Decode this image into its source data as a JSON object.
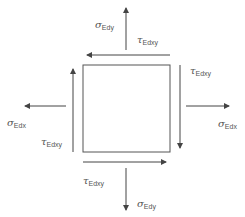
{
  "diagram": {
    "colors": {
      "line": "#444444",
      "text": "#555555",
      "background": "#ffffff"
    },
    "element": {
      "shape": "square"
    },
    "labels": {
      "sigma_top": {
        "symbol": "σ",
        "subscript": "Edy"
      },
      "tau_top": {
        "symbol": "τ",
        "subscript": "Edxy"
      },
      "tau_right": {
        "symbol": "τ",
        "subscript": "Edxy"
      },
      "sigma_left": {
        "symbol": "σ",
        "subscript": "Edx"
      },
      "sigma_right": {
        "symbol": "σ",
        "subscript": "Edx"
      },
      "tau_left": {
        "symbol": "τ",
        "subscript": "Edxy"
      },
      "tau_bottom": {
        "symbol": "τ",
        "subscript": "Edxy"
      },
      "sigma_bottom": {
        "symbol": "σ",
        "subscript": "Edy"
      }
    },
    "arrows": [
      {
        "name": "sigma-top-arrow",
        "direction": "up"
      },
      {
        "name": "tau-top-arrow",
        "direction": "left"
      },
      {
        "name": "tau-right-arrow",
        "direction": "down"
      },
      {
        "name": "tau-left-arrow",
        "direction": "up"
      },
      {
        "name": "tau-bottom-arrow",
        "direction": "right"
      },
      {
        "name": "sigma-bottom-arrow",
        "direction": "down"
      },
      {
        "name": "sigma-left-arrow",
        "direction": "left"
      },
      {
        "name": "sigma-right-arrow",
        "direction": "right"
      }
    ]
  }
}
